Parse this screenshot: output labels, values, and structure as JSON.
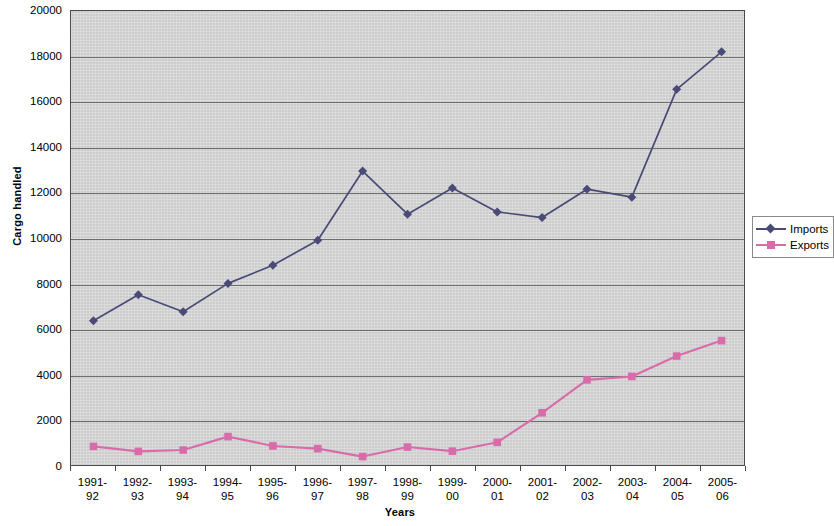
{
  "chart_data": {
    "type": "line",
    "title": "",
    "xlabel": "Years",
    "ylabel": "Cargo handled",
    "ylim": [
      0,
      20000
    ],
    "ytick_step": 2000,
    "yticks": [
      0,
      2000,
      4000,
      6000,
      8000,
      10000,
      12000,
      14000,
      16000,
      18000,
      20000
    ],
    "ytick_labels": [
      "0",
      "2000",
      "4000",
      "6000",
      "8000",
      "10000",
      "12000",
      "14000",
      "16000",
      "18000",
      "20000"
    ],
    "grid": true,
    "grid_axis": "y",
    "legend_position": "right",
    "categories": [
      "1991-92",
      "1992-93",
      "1993-94",
      "1994-95",
      "1995-96",
      "1996-97",
      "1997-98",
      "1998-99",
      "1999-00",
      "2000-01",
      "2001-02",
      "2002-03",
      "2003-04",
      "2004-05",
      "2005-06"
    ],
    "category_lines": [
      [
        "1991-",
        "92"
      ],
      [
        "1992-",
        "93"
      ],
      [
        "1993-",
        "94"
      ],
      [
        "1994-",
        "95"
      ],
      [
        "1995-",
        "96"
      ],
      [
        "1996-",
        "97"
      ],
      [
        "1997-",
        "98"
      ],
      [
        "1998-",
        "99"
      ],
      [
        "1999-",
        "00"
      ],
      [
        "2000-",
        "01"
      ],
      [
        "2001-",
        "02"
      ],
      [
        "2002-",
        "03"
      ],
      [
        "2003-",
        "04"
      ],
      [
        "2004-",
        "05"
      ],
      [
        "2005-",
        "06"
      ]
    ],
    "series": [
      {
        "name": "Imports",
        "color": "#4a4a78",
        "marker": "diamond",
        "values": [
          6350,
          7500,
          6750,
          8000,
          8800,
          9900,
          12950,
          11050,
          12200,
          11150,
          10900,
          12150,
          11800,
          16550,
          18200
        ]
      },
      {
        "name": "Exports",
        "color": "#d96bab",
        "marker": "square",
        "values": [
          820,
          600,
          660,
          1250,
          840,
          720,
          370,
          790,
          610,
          1000,
          2300,
          3750,
          3900,
          4800,
          5480
        ]
      }
    ]
  },
  "legend": {
    "items": [
      {
        "label": "Imports"
      },
      {
        "label": "Exports"
      }
    ]
  },
  "axes": {
    "y_title": "Cargo handled",
    "x_title": "Years"
  },
  "colors": {
    "plot_background": "#d6d6d6",
    "gridline": "#6e6e6e",
    "axis": "#4a4a4a",
    "imports": "#4a4a78",
    "exports": "#d96bab"
  }
}
